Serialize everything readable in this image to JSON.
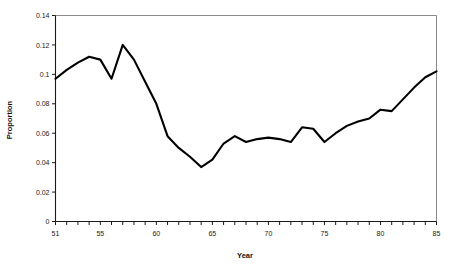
{
  "chart_data": {
    "type": "line",
    "title": "",
    "xlabel": "Year",
    "ylabel": "Proportion",
    "xlim": [
      51,
      85
    ],
    "ylim": [
      0,
      0.14
    ],
    "grid": false,
    "legend": null,
    "x_tick_labels": [
      "51",
      "55",
      "60",
      "65",
      "70",
      "75",
      "80",
      "85"
    ],
    "x_tick_values": [
      51,
      55,
      60,
      65,
      70,
      75,
      80,
      85
    ],
    "x_minor_tick_step": 1,
    "y_tick_labels": [
      "0",
      "0.02",
      "0.04",
      "0.06",
      "0.08",
      "0.1",
      "0.12",
      "0.14"
    ],
    "y_tick_values": [
      0,
      0.02,
      0.04,
      0.06,
      0.08,
      0.1,
      0.12,
      0.14
    ],
    "line_color": "#000000",
    "border_color": "#8a8a8a",
    "x": [
      51,
      52,
      53,
      54,
      55,
      56,
      57,
      58,
      59,
      60,
      61,
      62,
      63,
      64,
      65,
      66,
      67,
      68,
      69,
      70,
      71,
      72,
      73,
      74,
      75,
      76,
      77,
      78,
      79,
      80,
      81,
      82,
      83,
      84,
      85
    ],
    "values": [
      0.097,
      0.103,
      0.108,
      0.112,
      0.11,
      0.097,
      0.12,
      0.11,
      0.095,
      0.08,
      0.058,
      0.05,
      0.044,
      0.037,
      0.042,
      0.053,
      0.058,
      0.054,
      0.056,
      0.057,
      0.056,
      0.054,
      0.064,
      0.063,
      0.054,
      0.06,
      0.065,
      0.068,
      0.07,
      0.076,
      0.075,
      0.083,
      0.091,
      0.098,
      0.102
    ],
    "series": [
      {
        "name": "Proportion",
        "values": [
          0.097,
          0.103,
          0.108,
          0.112,
          0.11,
          0.097,
          0.12,
          0.11,
          0.095,
          0.08,
          0.058,
          0.05,
          0.044,
          0.037,
          0.042,
          0.053,
          0.058,
          0.054,
          0.056,
          0.057,
          0.056,
          0.054,
          0.064,
          0.063,
          0.054,
          0.06,
          0.065,
          0.068,
          0.07,
          0.076,
          0.075,
          0.083,
          0.091,
          0.098,
          0.102
        ]
      }
    ]
  }
}
